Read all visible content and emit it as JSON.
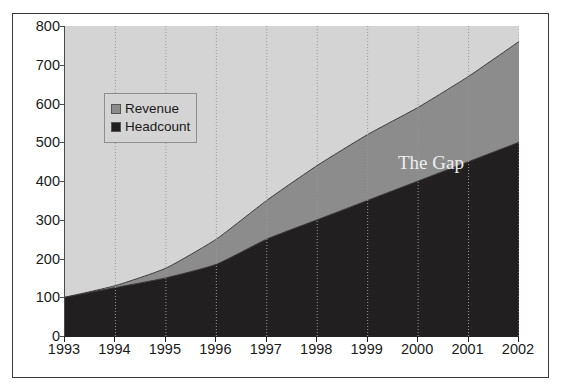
{
  "chart": {
    "title": "Index of Revenue & Headcount Growth (1993=100)",
    "annotation": "The Gap",
    "legend": [
      {
        "label": "Revenue",
        "color": "#8c8c8c"
      },
      {
        "label": "Headcount",
        "color": "#211f1f"
      }
    ]
  },
  "axes": {
    "y_ticks": [
      "0",
      "100",
      "200",
      "300",
      "400",
      "500",
      "600",
      "700",
      "800"
    ],
    "x_ticks": [
      "1993",
      "1994",
      "1995",
      "1996",
      "1997",
      "1998",
      "1999",
      "2000",
      "2001",
      "2002"
    ]
  },
  "colors": {
    "plot_background": "#d4d4d4",
    "revenue_band": "#8c8c8c",
    "headcount_band": "#211f1f",
    "axis": "#222222",
    "gridline": "#9a9a9a",
    "annotation_text": "#efefef",
    "figure_border": "#3a3a3a"
  },
  "chart_data": {
    "type": "area",
    "title": "Index of Revenue & Headcount Growth (1993=100)",
    "xlabel": "",
    "ylabel": "",
    "categories": [
      "1993",
      "1994",
      "1995",
      "1996",
      "1997",
      "1998",
      "1999",
      "2000",
      "2001",
      "2002"
    ],
    "series": [
      {
        "name": "Revenue",
        "color": "#8c8c8c",
        "values": [
          100,
          130,
          175,
          250,
          350,
          440,
          520,
          590,
          670,
          760
        ]
      },
      {
        "name": "Headcount",
        "color": "#211f1f",
        "values": [
          100,
          125,
          150,
          185,
          250,
          300,
          350,
          400,
          450,
          500
        ]
      }
    ],
    "ylim": [
      0,
      800
    ],
    "ytick_step": 100,
    "grid": true,
    "grid_axis": "x",
    "legend_position": "upper-left-inside",
    "annotations": [
      {
        "text": "The Gap",
        "x": "2000",
        "y": 470,
        "color": "#efefef"
      }
    ]
  }
}
